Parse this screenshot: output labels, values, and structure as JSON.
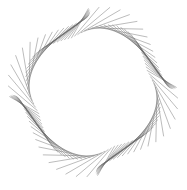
{
  "figure": {
    "background": "#ffffff",
    "stroke_color": "#6a6a6a",
    "center": [
      93,
      92
    ],
    "rotation_deg": -22,
    "sides": 4,
    "lines_per_side": 26,
    "inner_radius": 58,
    "outer_radius": 80,
    "twist": 0.55
  }
}
